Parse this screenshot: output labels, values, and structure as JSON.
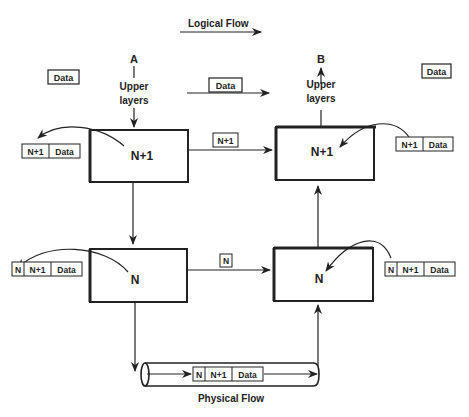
{
  "logical_flow_label": "Logical Flow",
  "physical_flow_label": "Physical Flow",
  "endpoint_a": "A",
  "endpoint_b": "B",
  "upper_layers_line1": "Upper",
  "upper_layers_line2": "layers",
  "left_data_label": "Data",
  "center_data_label": "Data",
  "right_data_label": "Data",
  "layer_n1_label": "N+1",
  "layer_n_label": "N",
  "pdu_n1_header": "N+1",
  "pdu_n_header": "N",
  "pdu_data": "Data",
  "link_n1_label": "N+1",
  "link_n_label": "N"
}
